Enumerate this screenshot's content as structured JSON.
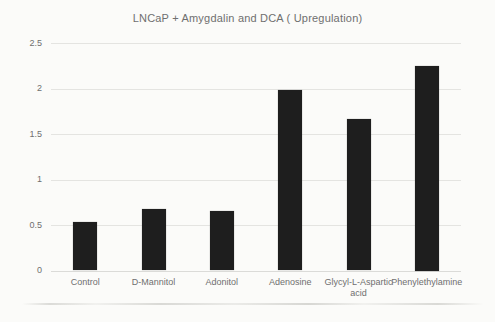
{
  "colors": {
    "background": "#fbfbf9",
    "text": "#6f6f6f",
    "gridline": "#e4e4e1",
    "bar": "#1e1e1e"
  },
  "chart_data": {
    "type": "bar",
    "title": "LNCaP + Amygdalin and DCA ( Upregulation)",
    "categories": [
      "Control",
      "D-Mannitol",
      "Adonitol",
      "Adenosine",
      "Glycyl-L-Aspartic acid",
      "Phenylethylamine"
    ],
    "values": [
      0.53,
      0.68,
      0.65,
      1.98,
      1.67,
      2.25
    ],
    "xlabel": "",
    "ylabel": "",
    "ylim": [
      0,
      2.5
    ],
    "yticks": [
      0,
      0.5,
      1,
      1.5,
      2,
      2.5
    ],
    "ytick_labels": [
      "0",
      "0.5",
      "1",
      "1.5",
      "2",
      "2.5"
    ],
    "grid": true,
    "legend": false
  }
}
